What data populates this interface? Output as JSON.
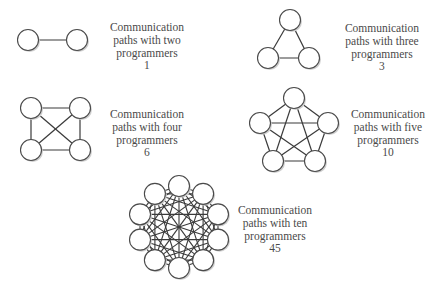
{
  "colors": {
    "background": "#ffffff",
    "edge": "#3a3a3a",
    "node_fill": "#ffffff",
    "node_stroke": "#4a4a4a",
    "node_shadow": "#cfcfcf",
    "text": "#4a4a4a"
  },
  "node_radius": 10.5,
  "groups": [
    {
      "id": "two",
      "programmers": 2,
      "paths": 1,
      "label": {
        "line1": "Communication",
        "line2": "paths with two",
        "line3": "programmers",
        "count": "1"
      },
      "label_pos": {
        "x": 147,
        "y": 21
      },
      "nodes": [
        [
          28,
          40
        ],
        [
          77,
          40
        ]
      ]
    },
    {
      "id": "three",
      "programmers": 3,
      "paths": 3,
      "label": {
        "line1": "Communication",
        "line2": "paths with three",
        "line3": "programmers",
        "count": "3"
      },
      "label_pos": {
        "x": 382,
        "y": 22
      },
      "nodes": [
        [
          290,
          20
        ],
        [
          268,
          58
        ],
        [
          309,
          58
        ]
      ]
    },
    {
      "id": "four",
      "programmers": 4,
      "paths": 6,
      "label": {
        "line1": "Communication",
        "line2": "paths with four",
        "line3": "programmers",
        "count": "6"
      },
      "label_pos": {
        "x": 147,
        "y": 108
      },
      "nodes": [
        [
          31,
          108
        ],
        [
          80,
          108
        ],
        [
          31,
          150
        ],
        [
          80,
          150
        ]
      ]
    },
    {
      "id": "five",
      "programmers": 5,
      "paths": 10,
      "label": {
        "line1": "Communication",
        "line2": "paths with five",
        "line3": "programmers",
        "count": "10"
      },
      "label_pos": {
        "x": 388,
        "y": 108
      },
      "nodes": [
        [
          294,
          98
        ],
        [
          260,
          123
        ],
        [
          328,
          123
        ],
        [
          273,
          161
        ],
        [
          315,
          161
        ]
      ]
    },
    {
      "id": "ten",
      "programmers": 10,
      "paths": 45,
      "label": {
        "line1": "Communication",
        "line2": "paths with ten",
        "line3": "programmers",
        "count": "45"
      },
      "label_pos": {
        "x": 275,
        "y": 204
      },
      "ring": {
        "cx": 179,
        "cy": 227,
        "r": 41,
        "count": 10
      }
    }
  ]
}
